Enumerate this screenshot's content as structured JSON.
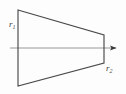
{
  "figure": {
    "name": "frustum-cross-section-with-axis",
    "caption": "",
    "background_color": "#fdfdfd",
    "stroke_color": "#4a4a4a",
    "axis_color": "#8c8c8c",
    "label_color": "#3d3d3d",
    "shape": {
      "name": "trapezoid-outline",
      "type": "isosceles-trapezoid",
      "points": "18,10 104,35 104,63 18,86",
      "fill": "none"
    },
    "axis": {
      "name": "horizontal-axis",
      "x_start": 10,
      "x_end": 116,
      "y": 48,
      "arrowhead": "right"
    },
    "labels": [
      {
        "name": "radius-label-1",
        "base": "r",
        "subscript": "1",
        "text": "r₁",
        "x": 9,
        "y": 27
      },
      {
        "name": "radius-label-2",
        "base": "r",
        "subscript": "2",
        "text": "r₂",
        "x": 106,
        "y": 71
      }
    ]
  }
}
